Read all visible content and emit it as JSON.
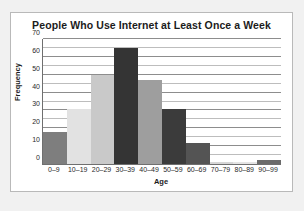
{
  "chart_data": {
    "type": "bar",
    "title": "People Who Use Internet at Least Once a Week",
    "xlabel": "Age",
    "ylabel": "Frequency",
    "categories": [
      "0–9",
      "10–19",
      "20–29",
      "30–39",
      "40–49",
      "50–59",
      "60–69",
      "70–79",
      "80–89",
      "90–99"
    ],
    "values": [
      18,
      31,
      50,
      65,
      47,
      31,
      12,
      1,
      1,
      2
    ],
    "ylim": [
      0,
      70
    ],
    "yticks": [
      0,
      10,
      20,
      30,
      40,
      50,
      60,
      70
    ],
    "ytick_labels": [
      "0",
      "10",
      "20",
      "30",
      "40",
      "50",
      "60",
      "70"
    ],
    "minor_ytick_step": 5,
    "grid": true,
    "legend": "none",
    "bar_colors": [
      "#7e7e7e",
      "#e2e2e2",
      "#c9c9c9",
      "#343434",
      "#9e9e9e",
      "#3b3b3b",
      "#545454",
      "#d6d6d6",
      "#e4e4e4",
      "#6b6b6b"
    ]
  }
}
